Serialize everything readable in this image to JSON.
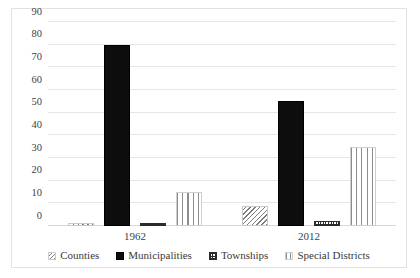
{
  "chart_data": {
    "type": "bar",
    "title": "",
    "subtitle": "",
    "xlabel": "",
    "ylabel": "",
    "categories": [
      "1962",
      "2012"
    ],
    "series": [
      {
        "name": "Counties",
        "values": [
          1,
          9
        ],
        "pattern": "diagonal-hatch",
        "color": "#7d7d7d"
      },
      {
        "name": "Municipalities",
        "values": [
          80,
          55
        ],
        "pattern": "solid",
        "color": "#0d0d0d"
      },
      {
        "name": "Townships",
        "values": [
          1.5,
          2
        ],
        "pattern": "cross-hatch",
        "color": "#2b2b2b"
      },
      {
        "name": "Special Districts",
        "values": [
          15,
          35
        ],
        "pattern": "vertical-lines",
        "color": "#8c8c8c"
      }
    ],
    "ylim": [
      0,
      90
    ],
    "yticks": [
      "0",
      "10",
      "20",
      "30",
      "40",
      "50",
      "60",
      "70",
      "80",
      "90"
    ],
    "grid": true,
    "legend_position": "bottom"
  },
  "legend": {
    "items": [
      {
        "label": "Counties"
      },
      {
        "label": "Municipalities"
      },
      {
        "label": "Townships"
      },
      {
        "label": "Special Districts"
      }
    ]
  }
}
